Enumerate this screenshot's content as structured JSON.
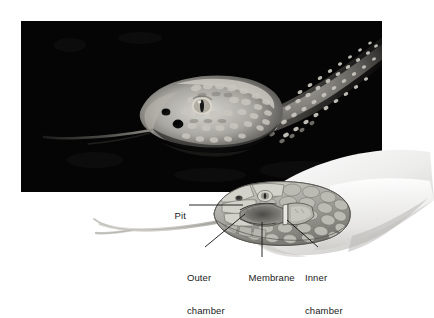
{
  "figure": {
    "kind": "scientific-illustration",
    "background_color": "#ffffff"
  },
  "photo": {
    "name": "rattlesnake-head-photograph",
    "description": "black and white photograph of a rattlesnake head with extended tongue against a black background",
    "frame_color": "#000000",
    "x": 21,
    "y": 21,
    "width": 361,
    "height": 171
  },
  "illustration": {
    "name": "pit-organ-cutaway-illustration",
    "description": "grayscale drawing of a snake head in profile with a cutaway showing the facial pit organ and forked tongue"
  },
  "labels": [
    {
      "id": "pit",
      "text": "Pit",
      "lines": [
        "Pit"
      ]
    },
    {
      "id": "outer_chamber",
      "text": "Outer chamber",
      "lines": [
        "Outer",
        "chamber"
      ]
    },
    {
      "id": "membrane",
      "text": "Membrane",
      "lines": [
        "Membrane"
      ]
    },
    {
      "id": "inner_chamber",
      "text": "Inner chamber",
      "lines": [
        "Inner",
        "chamber"
      ]
    }
  ],
  "label_text": {
    "pit": "Pit",
    "outer_line1": "Outer",
    "outer_line2": "chamber",
    "membrane": "Membrane",
    "inner_line1": "Inner",
    "inner_line2": "chamber"
  },
  "colors": {
    "text": "#1a1a1a",
    "leader_line": "#111111",
    "photo_background": "#000000",
    "page_background": "#ffffff",
    "snake_skin_light": "#c9c9c4",
    "snake_skin_mid": "#9a9a95",
    "snake_skin_dark": "#6e6e6a"
  }
}
